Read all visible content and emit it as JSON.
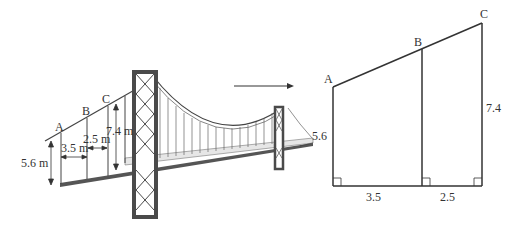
{
  "bridge": {
    "points": [
      "A",
      "B",
      "C"
    ],
    "heights": {
      "A": "5.6 m",
      "C": "7.4 m"
    },
    "spacings": {
      "AB": "3.5 m",
      "BC": "2.5 m"
    }
  },
  "arrow": {
    "direction": "right"
  },
  "model": {
    "points": [
      "A",
      "B",
      "C"
    ],
    "left_height": "5.6",
    "right_height": "7.4",
    "base_left": "3.5",
    "base_right": "2.5",
    "right_angles": 3
  },
  "colors": {
    "line": "#333333",
    "tower": "#4a4a4a",
    "deck": "#555555",
    "bg": "#ffffff"
  }
}
